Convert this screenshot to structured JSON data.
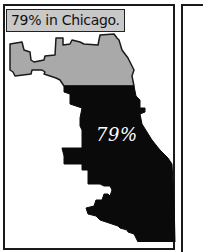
{
  "panel": {
    "caption": "79% in Chicago.",
    "map_label": "79%",
    "map_subject": "Chicago",
    "regions": [
      {
        "name": "north",
        "fill": "#a9a9a9",
        "percent": 21
      },
      {
        "name": "south",
        "fill": "#0a0a0a",
        "percent": 79
      }
    ]
  },
  "colors": {
    "border": "#1a1a1a",
    "caption_bg": "#c8c8c8",
    "gray_region": "#a9a9a9",
    "black_region": "#0a0a0a",
    "background": "#ffffff"
  }
}
